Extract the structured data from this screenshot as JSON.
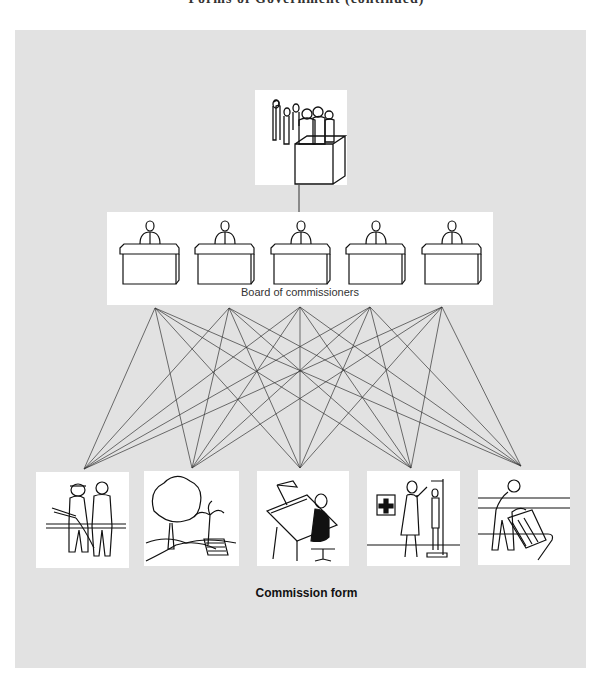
{
  "figure": {
    "partial_title": "Forms of Government (continued)",
    "board_label": "Board of commissioners",
    "caption": "Commission form",
    "panel_color": "#e2e2e2",
    "line_color": "#333333"
  },
  "nodes": {
    "voters": {
      "label": "voters-ballot-box-icon"
    },
    "commissioners": [
      {
        "icon": "commissioner-1-icon"
      },
      {
        "icon": "commissioner-2-icon"
      },
      {
        "icon": "commissioner-3-icon"
      },
      {
        "icon": "commissioner-4-icon"
      },
      {
        "icon": "commissioner-5-icon"
      }
    ],
    "departments": [
      {
        "icon": "fire-police-icon"
      },
      {
        "icon": "parks-icon"
      },
      {
        "icon": "planning-drafting-icon"
      },
      {
        "icon": "health-nurse-icon"
      },
      {
        "icon": "sanitation-icon"
      }
    ]
  },
  "connections": {
    "top_points": [
      [
        155,
        308
      ],
      [
        229,
        308
      ],
      [
        300,
        307
      ],
      [
        370,
        307
      ],
      [
        442,
        307
      ]
    ],
    "bottom_points": [
      [
        84,
        469
      ],
      [
        192,
        468
      ],
      [
        300,
        468
      ],
      [
        411,
        468
      ],
      [
        521,
        466
      ]
    ],
    "rule": "each commissioner connects to every department"
  }
}
